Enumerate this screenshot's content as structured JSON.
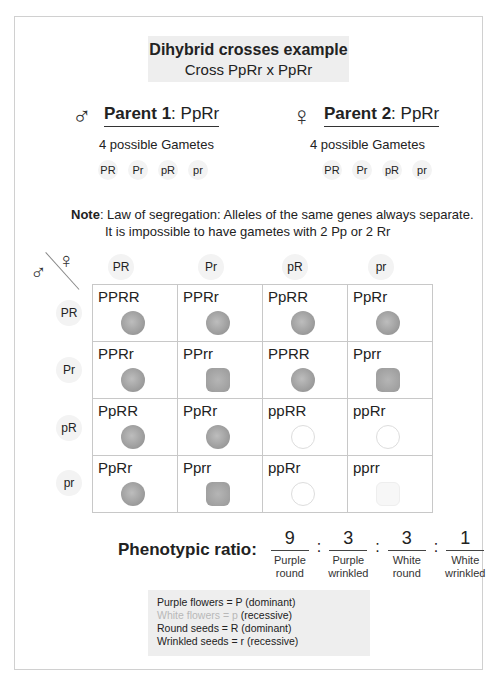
{
  "title": {
    "line1": "Dihybrid crosses example",
    "line2": "Cross PpRr x PpRr"
  },
  "parent1": {
    "symbol": "♂",
    "label": "Parent 1",
    "genotype": ": PpRr",
    "subtitle": "4 possible Gametes",
    "gametes": [
      "PR",
      "Pr",
      "pR",
      "pr"
    ]
  },
  "parent2": {
    "symbol": "♀",
    "label": "Parent 2",
    "genotype": ": PpRr",
    "subtitle": "4 possible Gametes",
    "gametes": [
      "PR",
      "Pr",
      "pR",
      "pr"
    ]
  },
  "note": {
    "label": "Note",
    "line1": ": Law of segregation: Alleles of the same genes always separate.",
    "line2": "It is impossible to have gametes with 2 Pp or 2 Rr"
  },
  "punnett": {
    "male_symbol": "♂",
    "female_symbol": "♀",
    "columns": [
      "PR",
      "Pr",
      "pR",
      "pr"
    ],
    "rows": [
      "PR",
      "Pr",
      "pR",
      "pr"
    ],
    "cells": [
      [
        {
          "g": "PPRR",
          "p": "round-purple"
        },
        {
          "g": "PPRr",
          "p": "round-purple"
        },
        {
          "g": "PpRR",
          "p": "round-purple"
        },
        {
          "g": "PpRr",
          "p": "round-purple"
        }
      ],
      [
        {
          "g": "PPRr",
          "p": "round-purple"
        },
        {
          "g": "PPrr",
          "p": "wrinkled-purple"
        },
        {
          "g": "PPRR",
          "p": "round-purple"
        },
        {
          "g": "Pprr",
          "p": "wrinkled-purple"
        }
      ],
      [
        {
          "g": "PpRR",
          "p": "round-purple"
        },
        {
          "g": "PpRr",
          "p": "round-purple"
        },
        {
          "g": "ppRR",
          "p": "round-white"
        },
        {
          "g": "ppRr",
          "p": "round-white"
        }
      ],
      [
        {
          "g": "PpRr",
          "p": "round-purple"
        },
        {
          "g": "Pprr",
          "p": "wrinkled-purple"
        },
        {
          "g": "ppRr",
          "p": "round-white"
        },
        {
          "g": "pprr",
          "p": "wrinkled-white"
        }
      ]
    ]
  },
  "ratio": {
    "label": "Phenotypic ratio:",
    "parts": [
      {
        "value": "9",
        "line1": "Purple",
        "line2": "round"
      },
      {
        "value": "3",
        "line1": "Purple",
        "line2": "wrinkled"
      },
      {
        "value": "3",
        "line1": "White",
        "line2": "round"
      },
      {
        "value": "1",
        "line1": "White",
        "line2": "wrinkled"
      }
    ],
    "separator": ":"
  },
  "legend": {
    "items": [
      {
        "text": "Purple flowers = P (dominant)",
        "class": ""
      },
      {
        "text": "White flowers = p",
        "suffix": " (recessive)",
        "class": "white-txt"
      },
      {
        "text": "Round seeds = R (dominant)",
        "class": ""
      },
      {
        "text": "Wrinkled seeds = r (recessive)",
        "class": ""
      }
    ]
  }
}
